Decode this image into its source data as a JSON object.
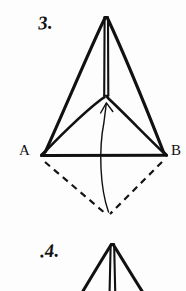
{
  "page": {
    "background_color": "#fdfdfd",
    "ink_color": "#111111",
    "width": 186,
    "height": 291
  },
  "figures": [
    {
      "id": "step-3",
      "number_label": "3.",
      "description": "Hand drawn triangular paper fold with center crease, labeled base corners A and B, dashed flap outline below the base and a curved arrow indicating the flap folds upward.",
      "vertex_labels": {
        "left": "A",
        "right": "B"
      },
      "geometry": {
        "apex": [
          106,
          16
        ],
        "base_left": [
          41,
          155
        ],
        "base_right": [
          166,
          155
        ],
        "crease_center": [
          106,
          97
        ],
        "dashed_flap_tip": [
          108,
          215
        ]
      },
      "line_styles": {
        "outline": "solid",
        "flap": "dashed",
        "motion": "curved-arrow"
      }
    },
    {
      "id": "step-4",
      "number_label": ".4.",
      "description": "Beginning of the next fold step, a narrower triangle apex with a double vertical center crease, cropped at the bottom edge of the page.",
      "geometry": {
        "apex": [
          112,
          243
        ],
        "left_foot": [
          82,
          291
        ],
        "right_foot": [
          142,
          291
        ]
      },
      "line_styles": {
        "outline": "solid",
        "crease": "double-line"
      }
    }
  ]
}
